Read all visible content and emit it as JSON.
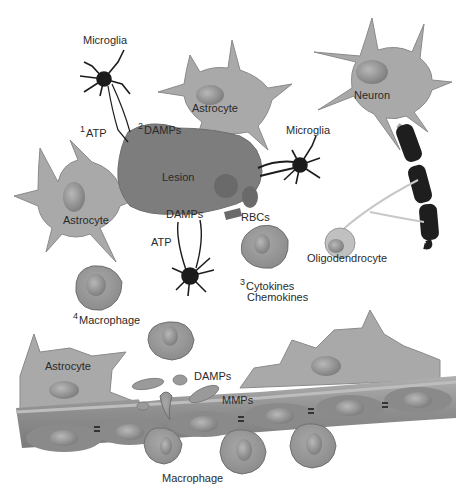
{
  "figure": {
    "type": "biological-diagram",
    "colors": {
      "background": "#ffffff",
      "astrocyte": "#a9a9a9",
      "astrocyte_outline": "#8a8a8a",
      "lesion": "#7d7d7d",
      "nucleus": "#8f8f8f",
      "microglia": "#1c1c1c",
      "rbc": "#6a6a6a",
      "myelin": "#202020",
      "vessel": "#8c8c8c",
      "vessel_band": "#a3a3a3",
      "macrophage": "#9a9a9a",
      "text": "#2a2a2a"
    }
  },
  "labels": {
    "microglia_top": "Microglia",
    "astrocyte_top": "Astrocyte",
    "neuron": "Neuron",
    "atp_1_num": "1",
    "atp_1": "ATP",
    "damps_2_num": "2",
    "damps_2": "DAMPs",
    "lesion": "Lesion",
    "microglia_right": "Microglia",
    "astrocyte_left": "Astrocyte",
    "damps_lesion": "DAMPs",
    "rbcs": "RBCs",
    "atp_lower": "ATP",
    "oligodendrocyte": "Oligodendrocyte",
    "cytokines_num": "3",
    "cytokines": "Cytokines",
    "chemokines": "Chemokines",
    "macrophage_4_num": "4",
    "macrophage_4": "Macrophage",
    "astrocyte_bottom": "Astrocyte",
    "damps_vessel": "DAMPs",
    "mmps": "MMPs",
    "macrophage_bottom": "Macrophage"
  }
}
